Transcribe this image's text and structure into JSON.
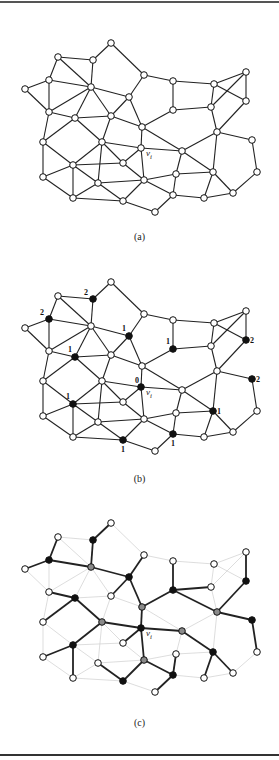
{
  "figure": {
    "panels": [
      {
        "id": "a",
        "caption": "(a)",
        "offset_y": 0,
        "caption_y": 231,
        "mode": "plain"
      },
      {
        "id": "b",
        "caption": "(b)",
        "offset_y": 239,
        "caption_y": 473,
        "mode": "labeled"
      },
      {
        "id": "c",
        "caption": "(c)",
        "offset_y": 480,
        "caption_y": 717,
        "mode": "tree"
      }
    ],
    "vertex_label": "v",
    "vertex_subscript": "i",
    "highlight_vertex": "V",
    "colors": {
      "edge": "#222222",
      "faint_edge": "#cfcfcf",
      "node_fill": "#ffffff",
      "black": "#111111",
      "gray": "#8a8a8a"
    }
  },
  "graph": {
    "nodes": {
      "A": [
        111,
        43
      ],
      "B": [
        58,
        57
      ],
      "C": [
        93,
        60
      ],
      "D": [
        49,
        80
      ],
      "E": [
        91,
        87
      ],
      "F": [
        25,
        89
      ],
      "G": [
        144,
        75
      ],
      "H": [
        173,
        81
      ],
      "I": [
        214,
        84
      ],
      "J": [
        246,
        72
      ],
      "K": [
        129,
        97
      ],
      "L": [
        49,
        112
      ],
      "M": [
        75,
        118
      ],
      "N": [
        111,
        116
      ],
      "O": [
        142,
        127
      ],
      "P": [
        173,
        110
      ],
      "Q": [
        211,
        107
      ],
      "R": [
        246,
        101
      ],
      "S": [
        217,
        132
      ],
      "T": [
        43,
        142
      ],
      "U": [
        102,
        142
      ],
      "V": [
        141,
        148
      ],
      "W": [
        182,
        151
      ],
      "X": [
        252,
        140
      ],
      "Y": [
        73,
        165
      ],
      "Z": [
        123,
        163
      ],
      "T2": [
        43,
        177
      ],
      "EE": [
        176,
        174
      ],
      "FF": [
        213,
        172
      ],
      "GG": [
        257,
        172
      ],
      "AA": [
        98,
        183
      ],
      "CC": [
        144,
        180
      ],
      "BB": [
        73,
        198
      ],
      "DD": [
        123,
        201
      ],
      "JJ": [
        173,
        195
      ],
      "II": [
        204,
        198
      ],
      "HH": [
        233,
        193
      ],
      "KK": [
        155,
        212
      ]
    },
    "edges": [
      [
        "A",
        "C"
      ],
      [
        "A",
        "G"
      ],
      [
        "B",
        "C"
      ],
      [
        "B",
        "D"
      ],
      [
        "B",
        "E"
      ],
      [
        "C",
        "E"
      ],
      [
        "D",
        "F"
      ],
      [
        "D",
        "E"
      ],
      [
        "D",
        "L"
      ],
      [
        "F",
        "L"
      ],
      [
        "E",
        "L"
      ],
      [
        "E",
        "M"
      ],
      [
        "E",
        "N"
      ],
      [
        "E",
        "K"
      ],
      [
        "L",
        "M"
      ],
      [
        "M",
        "N"
      ],
      [
        "N",
        "K"
      ],
      [
        "K",
        "G"
      ],
      [
        "G",
        "H"
      ],
      [
        "H",
        "P"
      ],
      [
        "H",
        "I"
      ],
      [
        "I",
        "J"
      ],
      [
        "I",
        "R"
      ],
      [
        "I",
        "Q"
      ],
      [
        "J",
        "Q"
      ],
      [
        "J",
        "R"
      ],
      [
        "P",
        "Q"
      ],
      [
        "P",
        "O"
      ],
      [
        "Q",
        "S"
      ],
      [
        "R",
        "S"
      ],
      [
        "K",
        "O"
      ],
      [
        "N",
        "O"
      ],
      [
        "O",
        "V"
      ],
      [
        "O",
        "W"
      ],
      [
        "S",
        "W"
      ],
      [
        "S",
        "X"
      ],
      [
        "V",
        "W"
      ],
      [
        "L",
        "T"
      ],
      [
        "M",
        "T"
      ],
      [
        "M",
        "U"
      ],
      [
        "N",
        "U"
      ],
      [
        "T",
        "Y"
      ],
      [
        "T",
        "T2"
      ],
      [
        "U",
        "Y"
      ],
      [
        "U",
        "V"
      ],
      [
        "U",
        "Z"
      ],
      [
        "U",
        "AA"
      ],
      [
        "Y",
        "Z"
      ],
      [
        "Y",
        "AA"
      ],
      [
        "Y",
        "BB"
      ],
      [
        "Y",
        "T2"
      ],
      [
        "T2",
        "BB"
      ],
      [
        "Z",
        "V"
      ],
      [
        "Z",
        "CC"
      ],
      [
        "AA",
        "CC"
      ],
      [
        "AA",
        "BB"
      ],
      [
        "AA",
        "DD"
      ],
      [
        "V",
        "CC"
      ],
      [
        "BB",
        "DD"
      ],
      [
        "DD",
        "KK"
      ],
      [
        "CC",
        "DD"
      ],
      [
        "CC",
        "EE"
      ],
      [
        "CC",
        "JJ"
      ],
      [
        "W",
        "EE"
      ],
      [
        "W",
        "FF"
      ],
      [
        "S",
        "FF"
      ],
      [
        "X",
        "GG"
      ],
      [
        "GG",
        "HH"
      ],
      [
        "FF",
        "HH"
      ],
      [
        "FF",
        "II"
      ],
      [
        "EE",
        "JJ"
      ],
      [
        "JJ",
        "II"
      ],
      [
        "JJ",
        "KK"
      ],
      [
        "HH",
        "II"
      ],
      [
        "EE",
        "FF"
      ]
    ],
    "labeled": {
      "black": {
        "C": "2",
        "D": "2",
        "K": "1",
        "M": "1",
        "P": "1",
        "R": "2",
        "V": "0",
        "X": "2",
        "Y": "1",
        "FF": "1",
        "JJ": "1",
        "DD": "1"
      }
    },
    "tree": {
      "black": [
        "C",
        "D",
        "K",
        "M",
        "P",
        "R",
        "V",
        "X",
        "Y",
        "FF",
        "JJ",
        "DD"
      ],
      "gray": [
        "E",
        "O",
        "U",
        "W",
        "S",
        "CC"
      ],
      "edges": [
        [
          "B",
          "D"
        ],
        [
          "F",
          "D"
        ],
        [
          "D",
          "E"
        ],
        [
          "E",
          "C"
        ],
        [
          "C",
          "A"
        ],
        [
          "E",
          "K"
        ],
        [
          "K",
          "G"
        ],
        [
          "K",
          "N"
        ],
        [
          "K",
          "O"
        ],
        [
          "O",
          "V"
        ],
        [
          "O",
          "P"
        ],
        [
          "P",
          "H"
        ],
        [
          "P",
          "Q"
        ],
        [
          "P",
          "S"
        ],
        [
          "S",
          "R"
        ],
        [
          "R",
          "J"
        ],
        [
          "S",
          "X"
        ],
        [
          "X",
          "GG"
        ],
        [
          "V",
          "U"
        ],
        [
          "U",
          "M"
        ],
        [
          "M",
          "L"
        ],
        [
          "M",
          "T"
        ],
        [
          "U",
          "Y"
        ],
        [
          "Y",
          "T2"
        ],
        [
          "Y",
          "BB"
        ],
        [
          "V",
          "Z"
        ],
        [
          "V",
          "W"
        ],
        [
          "W",
          "FF"
        ],
        [
          "FF",
          "HH"
        ],
        [
          "FF",
          "II"
        ],
        [
          "V",
          "CC"
        ],
        [
          "CC",
          "DD"
        ],
        [
          "DD",
          "AA"
        ],
        [
          "CC",
          "JJ"
        ],
        [
          "JJ",
          "EE"
        ],
        [
          "JJ",
          "KK"
        ]
      ]
    }
  }
}
